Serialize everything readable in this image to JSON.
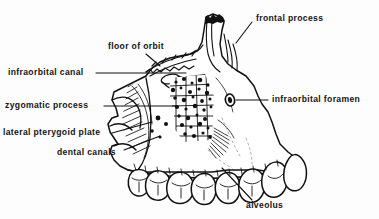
{
  "figure": {
    "background_color": "#fdfdfd",
    "ink_color": "#111111",
    "labels": [
      {
        "id": "frontal-process",
        "text": "frontal process",
        "x": 256,
        "y": 14
      },
      {
        "id": "floor-of-orbit",
        "text": "floor of orbit",
        "x": 108,
        "y": 42
      },
      {
        "id": "infraorbital-canal",
        "text": "infraorbital canal",
        "x": 8,
        "y": 70
      },
      {
        "id": "infraorbital-foramen",
        "text": "infraorbital foramen",
        "x": 272,
        "y": 95
      },
      {
        "id": "zygomatic-process",
        "text": "zygomatic process",
        "x": 5,
        "y": 101
      },
      {
        "id": "lateral-pterygoid-plate",
        "text": "lateral pterygoid plate",
        "x": 3,
        "y": 129
      },
      {
        "id": "dental-canals",
        "text": "dental canals",
        "x": 57,
        "y": 149
      },
      {
        "id": "alveolus",
        "text": "alveolus",
        "x": 246,
        "y": 203
      }
    ],
    "leader_lines": [
      {
        "id": "leader-frontal-process",
        "points": "252,22 236,43"
      },
      {
        "id": "leader-floor-of-orbit",
        "points": "146,54 160,66"
      },
      {
        "id": "leader-infraorbital-canal",
        "points": "96,73 186,73"
      },
      {
        "id": "leader-infraorbital-foramen",
        "points": "268,100 232,100"
      },
      {
        "id": "leader-zygomatic-process",
        "points": "104,106 176,106"
      },
      {
        "id": "leader-lateral-pterygoid-plate",
        "points": "112,133 152,122"
      },
      {
        "id": "leader-dental-canals",
        "points": "124,150 160,136"
      },
      {
        "id": "leader-alveolus",
        "points": "252,200 222,168"
      }
    ]
  }
}
